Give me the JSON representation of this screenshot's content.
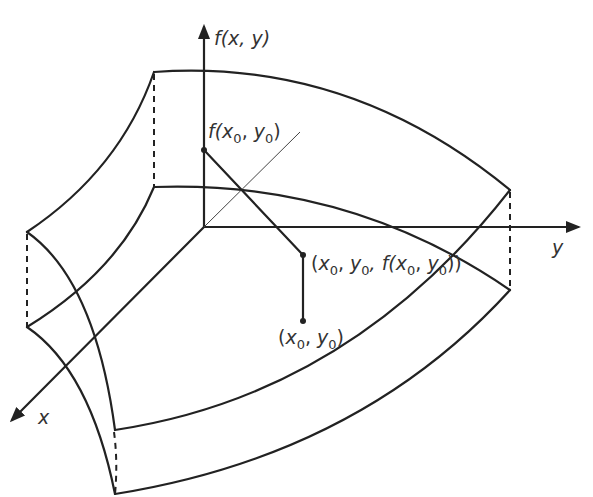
{
  "figure": {
    "type": "3D surface of a function f(x, y) with a point on the surface projected onto the xy-plane",
    "axes": {
      "vertical": {
        "label": "f(x, y)"
      },
      "x": {
        "label": "x"
      },
      "y": {
        "label": "y"
      }
    },
    "labels": {
      "surface_value": {
        "prefix": "f(",
        "v1": "x",
        "s1": "0",
        "sep": ", ",
        "v2": "y",
        "s2": "0",
        "suffix": ")"
      },
      "surface_point": {
        "prefix": "(",
        "v1": "x",
        "s1": "0",
        "sep1": ", ",
        "v2": "y",
        "s2": "0",
        "sep2": ", f(",
        "v3": "x",
        "s3": "0",
        "sep3": ", ",
        "v4": "y",
        "s4": "0",
        "suffix": "))"
      },
      "domain_point": {
        "prefix": "(",
        "v1": "x",
        "s1": "0",
        "sep": ", ",
        "v2": "y",
        "s2": "0",
        "suffix": ")"
      }
    },
    "colors": {
      "line": "#222222",
      "text": "#333333",
      "background": "#ffffff"
    }
  }
}
